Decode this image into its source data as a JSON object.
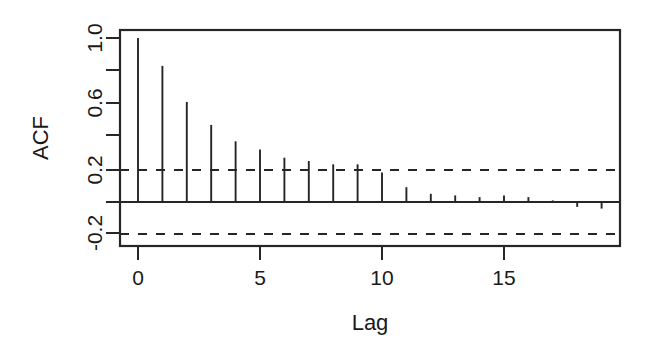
{
  "figure": {
    "background": "#ffffff",
    "foreground": "#262626"
  },
  "chart_data": {
    "type": "bar",
    "chart_subtype": "acf-correlogram",
    "title": "",
    "xlabel": "Lag",
    "ylabel": "ACF",
    "x": [
      0,
      1,
      2,
      3,
      4,
      5,
      6,
      7,
      8,
      9,
      10,
      11,
      12,
      13,
      14,
      15,
      16,
      17,
      18,
      19
    ],
    "values": [
      1.0,
      0.83,
      0.61,
      0.47,
      0.37,
      0.32,
      0.27,
      0.25,
      0.23,
      0.23,
      0.18,
      0.09,
      0.05,
      0.04,
      0.03,
      0.04,
      0.03,
      0.01,
      -0.03,
      -0.04
    ],
    "categories": [
      "0",
      "1",
      "2",
      "3",
      "4",
      "5",
      "6",
      "7",
      "8",
      "9",
      "10",
      "11",
      "12",
      "13",
      "14",
      "15",
      "16",
      "17",
      "18",
      "19"
    ],
    "xlim": [
      -0.6,
      19.8
    ],
    "ylim": [
      -0.28,
      1.06
    ],
    "xticks": [
      0,
      5,
      10,
      15
    ],
    "xtick_labels": [
      "0",
      "5",
      "10",
      "15"
    ],
    "yticks": [
      1.0,
      0.8,
      0.6,
      0.4,
      0.2,
      0.0,
      -0.2
    ],
    "ytick_labels": [
      "1.0",
      "",
      "0.6",
      "",
      "0.2",
      "",
      "-0.2"
    ],
    "confidence_bands": [
      0.195,
      -0.195
    ],
    "confidence_style": "dashed",
    "zero_line": 0.0,
    "grid": false,
    "legend": null
  },
  "labels": {
    "y_axis_title": "ACF",
    "x_axis_title": "Lag",
    "ytick_1_0": "1.0",
    "ytick_0_6": "0.6",
    "ytick_0_2": "0.2",
    "ytick_neg_0_2": "-0.2",
    "xtick_0": "0",
    "xtick_5": "5",
    "xtick_10": "10",
    "xtick_15": "15"
  }
}
